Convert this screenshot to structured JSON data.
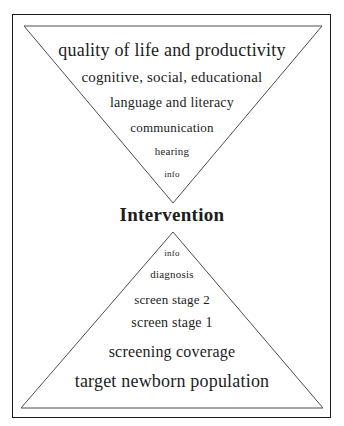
{
  "diagram": {
    "center_label": "Intervention",
    "top_pyramid": {
      "shape": "inverted-triangle",
      "levels": [
        "quality of life and productivity",
        "cognitive, social, educational",
        "language and literacy",
        "communication",
        "hearing",
        "info"
      ]
    },
    "bottom_pyramid": {
      "shape": "upright-triangle",
      "levels": [
        "info",
        "diagnosis",
        "screen stage 2",
        "screen stage 1",
        "screening coverage",
        "target newborn population"
      ]
    },
    "colors": {
      "background": "#ffffff",
      "frame_border": "#1c1c1c",
      "pyramid_outline": "#4d4d4d",
      "text": "#1c1c1c"
    }
  }
}
